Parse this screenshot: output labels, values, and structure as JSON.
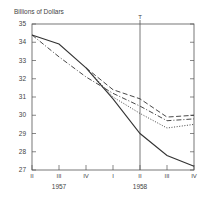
{
  "chart_data": {
    "type": "line",
    "title": "",
    "ylabel": "Billions of Dollars",
    "xlabel": "",
    "ylim": [
      27,
      35
    ],
    "yticks": [
      27,
      28,
      29,
      30,
      31,
      32,
      33,
      34,
      35
    ],
    "categories": [
      "II",
      "III",
      "IV",
      "I",
      "II",
      "III",
      "IV"
    ],
    "year_labels": [
      {
        "label": "1957",
        "under_index": 1
      },
      {
        "label": "1958",
        "under_index": 4
      }
    ],
    "vertical_marker": {
      "label": "T",
      "at_index": 4
    },
    "grid": false,
    "legend": null,
    "series": [
      {
        "name": "solid",
        "style": "solid",
        "values": [
          34.4,
          33.9,
          32.6,
          30.9,
          29.0,
          27.8,
          27.2
        ]
      },
      {
        "name": "dash-dot",
        "style": "dashdot",
        "values": [
          34.4,
          33.2,
          32.1,
          31.2,
          30.5,
          29.7,
          29.8
        ]
      },
      {
        "name": "long-dash",
        "style": "dashed",
        "values": [
          null,
          null,
          32.6,
          31.4,
          30.9,
          29.9,
          30.0
        ]
      },
      {
        "name": "dotted",
        "style": "dotted",
        "values": [
          null,
          null,
          32.6,
          31.0,
          30.1,
          29.3,
          29.5
        ]
      }
    ]
  }
}
